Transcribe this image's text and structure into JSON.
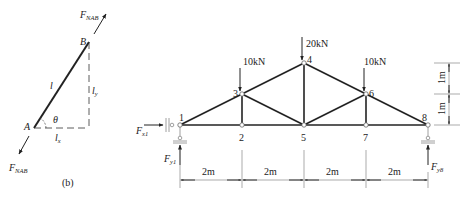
{
  "left_figure": {
    "caption": "(b)",
    "force_top": {
      "main": "F",
      "sub": "NAB"
    },
    "force_bottom": {
      "main": "F",
      "sub": "NAB"
    },
    "point_A": "A",
    "point_B": "B",
    "length": "l",
    "length_y": {
      "main": "l",
      "sub": "y"
    },
    "length_x": {
      "main": "l",
      "sub": "x"
    },
    "angle": "θ"
  },
  "truss": {
    "nodes": [
      {
        "id": "1",
        "x": 0,
        "y": 0
      },
      {
        "id": "2",
        "x": 2,
        "y": 0
      },
      {
        "id": "3",
        "x": 2,
        "y": 1
      },
      {
        "id": "4",
        "x": 4,
        "y": 2
      },
      {
        "id": "5",
        "x": 4,
        "y": 0
      },
      {
        "id": "6",
        "x": 6,
        "y": 1
      },
      {
        "id": "7",
        "x": 6,
        "y": 0
      },
      {
        "id": "8",
        "x": 8,
        "y": 0
      }
    ],
    "loads": [
      {
        "node": "3",
        "label": "10kN"
      },
      {
        "node": "4",
        "label": "20kN"
      },
      {
        "node": "6",
        "label": "10kN"
      }
    ],
    "reactions": {
      "fx1": {
        "main": "F",
        "sub": "x1"
      },
      "fy1": {
        "main": "F",
        "sub": "y1"
      },
      "fy8": {
        "main": "F",
        "sub": "y8"
      }
    },
    "spans": [
      "2m",
      "2m",
      "2m",
      "2m"
    ],
    "heights": [
      "1m",
      "1m"
    ]
  }
}
